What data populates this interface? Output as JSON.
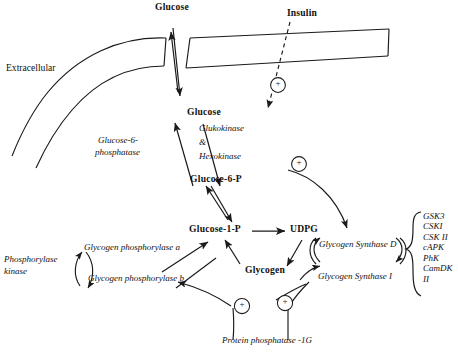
{
  "figure": {
    "colors": {
      "line": "#1a1a1a",
      "text": "#111111",
      "background": "#ffffff"
    }
  },
  "labels": {
    "glucose_extracellular": "Glucose",
    "extracellular": "Extracellular",
    "insulin": "Insulin",
    "glucose_intracellular": "Glucose",
    "glucose_6_p": "Glucose-6-P",
    "glucose_1_p": "Glucose-1-P",
    "udpg": "UDPG",
    "glycogen": "Glycogen"
  },
  "enzymes": {
    "glucokinase_hexokinase_line1": "Glukokinase",
    "glucokinase_hexokinase_line2": "&",
    "glucokinase_hexokinase_line3": "Hexokinase",
    "glucose_6_phosphatase_line1": "Glucose-6-",
    "glucose_6_phosphatase_line2": "phosphatase",
    "phosphorylase_kinase_line1": "Phosphorylase",
    "phosphorylase_kinase_line2": "kinase",
    "glycogen_phosphorylase_a": "Glycogen phosphorylase a",
    "glycogen_phosphorylase_b": "Glycogen phosphorylase b",
    "glycogen_synthase_d": "Glycogen Synthase D",
    "glycogen_synthase_i": "Glycogen Synthase I",
    "protein_phosphatase": "Protein phosphatase -1G"
  },
  "kinases": {
    "items": [
      "GSK3",
      "CSKI",
      "CSK II",
      "cAPK",
      "PhK",
      "CamDK",
      "II"
    ]
  },
  "modifiers": {
    "plus_sign": "+",
    "insulin_plus": "+",
    "g6p_plus": "+",
    "phosphatase_plus_left": "+",
    "phosphatase_plus_right": "+"
  },
  "icons": {
    "plus_circle": "plus-circle-icon",
    "arrow_head": "arrow-head-icon",
    "membrane": "cell-membrane-icon",
    "bracket": "curly-brace-icon"
  }
}
